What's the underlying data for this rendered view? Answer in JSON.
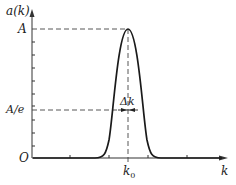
{
  "figure": {
    "y_axis_label": "a(k)",
    "x_axis_label": "k",
    "origin_label": "O",
    "peak_label": "A",
    "level_label": "A/e",
    "width_label": "Δk",
    "center_label": "k0",
    "center_label_main": "k",
    "center_label_sub": "0",
    "curve_color": "#1a1a1a",
    "axis_color": "#333333"
  }
}
